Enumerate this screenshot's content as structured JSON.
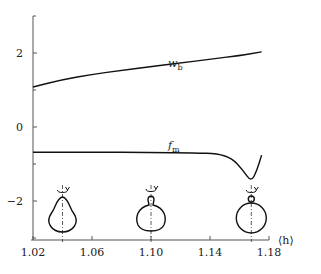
{
  "chart_data": {
    "type": "line",
    "title": "",
    "xlabel": "⟨h⟩",
    "ylabel": "",
    "xlim": [
      1.02,
      1.18
    ],
    "ylim": [
      -3,
      3
    ],
    "x_ticks": [
      "1.02",
      "1.06",
      "1.10",
      "1.14",
      "1.18"
    ],
    "y_ticks": [
      "2",
      "0",
      "-2"
    ],
    "y_minor_ticks": [
      3,
      1,
      -1,
      -3
    ],
    "grid": false,
    "legend": "inline labels",
    "series": [
      {
        "name": "w_b",
        "label_main": "w",
        "label_sub": "b",
        "points": [
          [
            1.02,
            1.08
          ],
          [
            1.04,
            1.28
          ],
          [
            1.06,
            1.42
          ],
          [
            1.08,
            1.53
          ],
          [
            1.1,
            1.63
          ],
          [
            1.12,
            1.73
          ],
          [
            1.14,
            1.83
          ],
          [
            1.16,
            1.93
          ],
          [
            1.175,
            2.03
          ]
        ]
      },
      {
        "name": "f_m",
        "label_main": "f",
        "label_sub": "m",
        "points": [
          [
            1.02,
            -0.68
          ],
          [
            1.06,
            -0.68
          ],
          [
            1.1,
            -0.69
          ],
          [
            1.13,
            -0.7
          ],
          [
            1.145,
            -0.72
          ],
          [
            1.155,
            -0.85
          ],
          [
            1.162,
            -1.15
          ],
          [
            1.168,
            -1.49
          ],
          [
            1.172,
            -1.15
          ],
          [
            1.175,
            -0.76
          ]
        ]
      }
    ],
    "annotations": [
      {
        "type": "shape-icon",
        "name": "pear-shape",
        "x": 1.04,
        "desc": "pear-shaped drop with rotation arrow on axis"
      },
      {
        "type": "shape-icon",
        "name": "necked-shape",
        "x": 1.1,
        "desc": "round body with narrow neck and small cap, rotation arrow"
      },
      {
        "type": "shape-icon",
        "name": "pinched-shape",
        "x": 1.168,
        "desc": "round body with small detached bead on top, rotation arrow"
      }
    ]
  }
}
